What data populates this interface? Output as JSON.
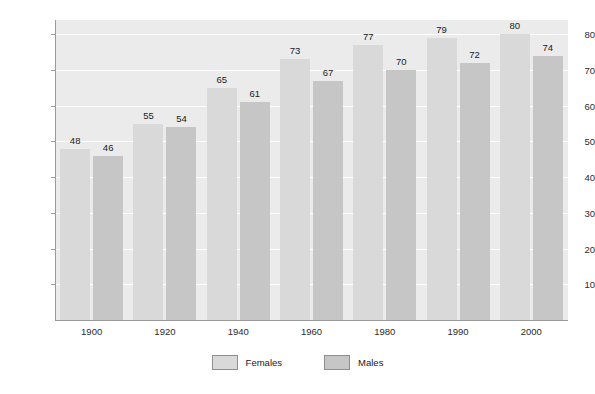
{
  "chart_data": {
    "type": "bar",
    "title": "",
    "subtitle": "",
    "xlabel": "",
    "ylabel": "Age",
    "categories": [
      "1900",
      "1920",
      "1940",
      "1960",
      "1980",
      "1990",
      "2000"
    ],
    "series": [
      {
        "name": "Females",
        "values": [
          48,
          55,
          65,
          73,
          77,
          79,
          80
        ],
        "color": "#d9d9d9"
      },
      {
        "name": "Males",
        "values": [
          46,
          54,
          61,
          67,
          70,
          72,
          74
        ],
        "color": "#c6c6c6"
      }
    ],
    "ylim": [
      0,
      84
    ],
    "yticks": [
      10,
      20,
      30,
      40,
      50,
      60,
      70,
      80
    ],
    "ytick_labels": [
      "10",
      "20",
      "30",
      "40",
      "50",
      "60",
      "70",
      "80"
    ],
    "grid": true,
    "grid_color": "#ffffff",
    "plot_background": "#ebebeb",
    "figure_background": "#ffffff",
    "legend_position": "bottom-center",
    "data_labels": true
  },
  "legend": {
    "items": [
      {
        "label": "Females",
        "color": "#d9d9d9"
      },
      {
        "label": "Males",
        "color": "#c6c6c6"
      }
    ]
  }
}
